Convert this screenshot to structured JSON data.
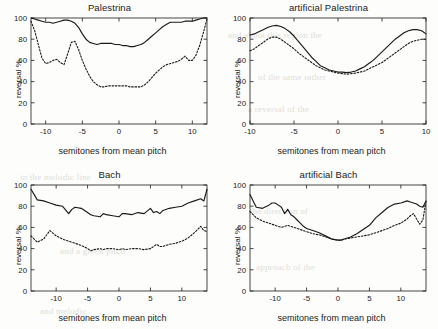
{
  "figure": {
    "background_color": "#fdfdfb",
    "line_color": "#1a1a1a",
    "subplot_count": 4
  },
  "axis_labels": {
    "xlabel": "semitones from mean pitch",
    "ylabel": "reversal %"
  },
  "subplots": [
    {
      "title": "Palestrina"
    },
    {
      "title": "artificial Palestrina"
    },
    {
      "title": "Bach"
    },
    {
      "title": "artificial Bach"
    }
  ],
  "chart_data": [
    {
      "type": "line",
      "title": "Palestrina",
      "xlabel": "semitones from mean pitch",
      "ylabel": "reversal %",
      "xlim": [
        -12,
        12
      ],
      "ylim": [
        0,
        100
      ],
      "xticks": [
        -10,
        -5,
        0,
        5,
        10
      ],
      "yticks": [
        0,
        20,
        40,
        60,
        80,
        100
      ],
      "grid": false,
      "legend_position": "none",
      "x": [
        -12,
        -11.5,
        -11,
        -10.5,
        -10,
        -9.5,
        -9,
        -8.5,
        -8,
        -7.5,
        -7,
        -6.5,
        -6,
        -5.5,
        -5,
        -4.5,
        -4,
        -3.5,
        -3,
        -2.5,
        -2,
        -1.5,
        -1,
        -0.5,
        0,
        0.5,
        1,
        1.5,
        2,
        2.5,
        3,
        3.5,
        4,
        4.5,
        5,
        5.5,
        6,
        6.5,
        7,
        7.5,
        8,
        8.5,
        9,
        9.5,
        10,
        10.5,
        11,
        11.5,
        12
      ],
      "series": [
        {
          "name": "real (solid)",
          "style": "solid",
          "values": [
            100,
            99,
            98,
            97,
            96,
            96,
            95,
            96,
            97,
            98,
            98,
            97,
            95,
            91,
            85,
            80,
            77,
            76,
            75,
            76,
            76,
            76,
            76,
            75,
            75,
            74,
            74,
            73,
            73,
            74,
            75,
            77,
            80,
            83,
            86,
            89,
            92,
            94,
            96,
            96,
            96,
            96,
            97,
            97,
            97,
            98,
            99,
            100,
            100
          ]
        },
        {
          "name": "artificial/shuffled (dashed)",
          "style": "dashed",
          "values": [
            97,
            88,
            75,
            62,
            57,
            58,
            60,
            61,
            58,
            56,
            66,
            77,
            78,
            70,
            60,
            52,
            45,
            40,
            37,
            35,
            35,
            36,
            36,
            36,
            36,
            36,
            36,
            35,
            35,
            35,
            35,
            37,
            40,
            44,
            48,
            51,
            54,
            56,
            57,
            58,
            59,
            61,
            64,
            60,
            60,
            65,
            74,
            86,
            99
          ]
        }
      ]
    },
    {
      "type": "line",
      "title": "artificial Palestrina",
      "xlabel": "semitones from mean pitch",
      "ylabel": "reversal %",
      "xlim": [
        -10,
        10
      ],
      "ylim": [
        0,
        100
      ],
      "xticks": [
        -10,
        -5,
        0,
        5,
        10
      ],
      "yticks": [
        0,
        20,
        40,
        60,
        80,
        100
      ],
      "grid": false,
      "legend_position": "none",
      "x": [
        -10,
        -9.5,
        -9,
        -8.5,
        -8,
        -7.5,
        -7,
        -6.5,
        -6,
        -5.5,
        -5,
        -4.5,
        -4,
        -3.5,
        -3,
        -2.5,
        -2,
        -1.5,
        -1,
        -0.5,
        0,
        0.5,
        1,
        1.5,
        2,
        2.5,
        3,
        3.5,
        4,
        4.5,
        5,
        5.5,
        6,
        6.5,
        7,
        7.5,
        8,
        8.5,
        9,
        9.5,
        10
      ],
      "series": [
        {
          "name": "real (solid)",
          "style": "solid",
          "values": [
            84,
            85,
            87,
            89,
            91,
            92.5,
            93,
            92,
            90,
            87,
            83,
            78,
            73,
            68,
            63,
            59,
            55,
            53,
            51,
            50,
            49,
            49,
            48.5,
            49,
            50,
            52,
            54,
            57,
            60,
            64,
            68,
            72,
            76,
            80,
            83,
            86,
            88,
            89,
            89,
            88,
            85
          ]
        },
        {
          "name": "artificial/shuffled (dashed)",
          "style": "dashed",
          "values": [
            69,
            71,
            74,
            77,
            80,
            82,
            82,
            80,
            77,
            74,
            71,
            67,
            64,
            61,
            58,
            55,
            53,
            51,
            50,
            49,
            48,
            47.5,
            47,
            47.5,
            48,
            49,
            50,
            52,
            54,
            56,
            58,
            61,
            64,
            67,
            70,
            73,
            76,
            78,
            79,
            80,
            80
          ]
        }
      ]
    },
    {
      "type": "line",
      "title": "Bach",
      "xlabel": "semitones from mean pitch",
      "ylabel": "reversal %",
      "xlim": [
        -14,
        14
      ],
      "ylim": [
        0,
        100
      ],
      "xticks": [
        -10,
        -5,
        0,
        5,
        10
      ],
      "yticks": [
        0,
        20,
        40,
        60,
        80,
        100
      ],
      "grid": false,
      "legend_position": "none",
      "x": [
        -14,
        -13,
        -12,
        -11,
        -10,
        -9,
        -8,
        -7.5,
        -7,
        -6,
        -5,
        -4.5,
        -4,
        -3,
        -2.5,
        -2,
        -1,
        0,
        0.5,
        1,
        2,
        3,
        4,
        5,
        5.5,
        6,
        6.5,
        7,
        8,
        9,
        10,
        11,
        12,
        13,
        13.5,
        14
      ],
      "series": [
        {
          "name": "real (solid)",
          "style": "solid",
          "values": [
            96,
            86,
            85,
            83,
            81,
            80,
            73,
            77,
            79,
            78,
            74,
            72,
            71,
            70,
            73,
            72,
            71,
            70,
            73,
            73,
            72,
            74,
            73,
            78,
            74,
            75,
            73,
            76,
            78,
            79,
            80,
            83,
            85,
            87,
            85,
            96
          ]
        },
        {
          "name": "artificial/shuffled (dashed)",
          "style": "dashed",
          "values": [
            52,
            46,
            49,
            57,
            52,
            49,
            47,
            46,
            45,
            43,
            40,
            38,
            39,
            40,
            39,
            40,
            40,
            39,
            40,
            39,
            40,
            40,
            39,
            40,
            42,
            44,
            42,
            42,
            44,
            45,
            47,
            50,
            55,
            61,
            57,
            56
          ]
        }
      ]
    },
    {
      "type": "line",
      "title": "artificial Bach",
      "xlabel": "semitones from mean pitch",
      "ylabel": "reversal %",
      "xlim": [
        -14,
        14
      ],
      "ylim": [
        0,
        100
      ],
      "xticks": [
        -10,
        -5,
        0,
        5,
        10
      ],
      "yticks": [
        0,
        20,
        40,
        60,
        80,
        100
      ],
      "grid": false,
      "legend_position": "none",
      "x": [
        -14,
        -13.5,
        -13,
        -12,
        -11,
        -10.5,
        -10,
        -9.5,
        -9,
        -8.5,
        -8,
        -7.5,
        -7,
        -6.5,
        -6,
        -5.5,
        -5,
        -4.5,
        -4,
        -3,
        -2,
        -1,
        0,
        0.5,
        1,
        2,
        3,
        4,
        5,
        6,
        7,
        8,
        9,
        10,
        11,
        11.5,
        12,
        12.5,
        13,
        13.5,
        14
      ],
      "series": [
        {
          "name": "real (solid)",
          "style": "solid",
          "values": [
            91,
            85,
            79,
            78,
            81,
            83,
            83,
            81,
            79,
            73,
            77,
            72,
            70,
            67,
            64,
            61,
            59,
            58,
            57,
            55,
            52,
            49,
            48,
            48,
            49,
            51,
            54,
            58,
            62,
            69,
            74,
            79,
            82,
            83,
            85,
            84,
            83,
            82,
            80,
            79,
            85
          ]
        },
        {
          "name": "artificial/shuffled (dashed)",
          "style": "dashed",
          "values": [
            75,
            72,
            69,
            66,
            64,
            63,
            62,
            61,
            60,
            61,
            62,
            61,
            60,
            59,
            58,
            57,
            56,
            55,
            54,
            53,
            51,
            49,
            48,
            48,
            49,
            50,
            51,
            52,
            53,
            55,
            57,
            59,
            62,
            64,
            68,
            71,
            73,
            68,
            63,
            67,
            85
          ]
        }
      ]
    }
  ],
  "background_watermark": [
    "and about this region the",
    "of the same rather",
    "a reversal of the",
    "in the melodic line",
    "and a given pitch",
    "the direction of",
    "approach of the",
    "and melodic"
  ]
}
